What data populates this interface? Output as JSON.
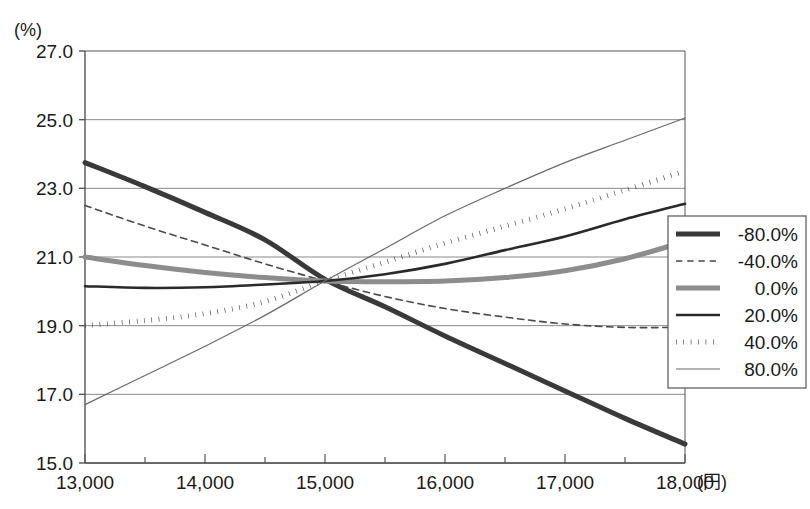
{
  "chart_data": {
    "type": "line",
    "title": "",
    "subtitle": "",
    "xlabel": "(円)",
    "ylabel": "(%)",
    "ylim": [
      15.0,
      27.0
    ],
    "xlim": [
      13000,
      18000
    ],
    "grid": true,
    "legend_position": "right",
    "y_ticks": [
      "15.0",
      "17.0",
      "19.0",
      "21.0",
      "23.0",
      "25.0",
      "27.0"
    ],
    "y_tick_values": [
      15.0,
      17.0,
      19.0,
      21.0,
      23.0,
      25.0,
      27.0
    ],
    "x_ticks": [
      "13,000",
      "14,000",
      "15,000",
      "16,000",
      "17,000",
      "18,000"
    ],
    "x_tick_values": [
      13000,
      14000,
      15000,
      16000,
      17000,
      18000
    ],
    "x_minor_step": 500,
    "x": [
      13000,
      13500,
      14000,
      14500,
      15000,
      15500,
      16000,
      16500,
      17000,
      17500,
      18000
    ],
    "series": [
      {
        "name": "-80.0%",
        "style": "solid",
        "width": 5,
        "color": "#3a3a3a",
        "values": [
          23.75,
          23.05,
          22.3,
          21.5,
          20.35,
          19.55,
          18.7,
          17.9,
          17.1,
          16.3,
          15.55
        ]
      },
      {
        "name": "-40.0%",
        "style": "dashed",
        "width": 1.6,
        "color": "#4a4a4a",
        "values": [
          22.5,
          21.9,
          21.35,
          20.8,
          20.3,
          19.85,
          19.5,
          19.25,
          19.05,
          18.95,
          18.95
        ]
      },
      {
        "name": "0.0%",
        "style": "solid",
        "width": 5,
        "color": "#8d8d8d",
        "values": [
          21.0,
          20.75,
          20.55,
          20.4,
          20.3,
          20.28,
          20.3,
          20.4,
          20.6,
          20.95,
          21.45
        ]
      },
      {
        "name": "20.0%",
        "style": "solid",
        "width": 2.6,
        "color": "#2a2a2a",
        "values": [
          20.15,
          20.1,
          20.12,
          20.2,
          20.3,
          20.5,
          20.8,
          21.2,
          21.6,
          22.1,
          22.55
        ]
      },
      {
        "name": "40.0%",
        "style": "dotted",
        "width": 5,
        "color": "#3a3a3a",
        "values": [
          19.0,
          19.15,
          19.35,
          19.7,
          20.3,
          20.85,
          21.4,
          21.9,
          22.4,
          22.95,
          23.5
        ]
      },
      {
        "name": "80.0%",
        "style": "solid",
        "width": 1.2,
        "color": "#6a6a6a",
        "values": [
          16.7,
          17.55,
          18.4,
          19.3,
          20.3,
          21.25,
          22.2,
          23.0,
          23.75,
          24.4,
          25.05
        ]
      }
    ],
    "legend_entries": [
      {
        "label": "-80.0%",
        "style": "solid",
        "width": 5,
        "color": "#3a3a3a"
      },
      {
        "label": "-40.0%",
        "style": "dashed",
        "width": 1.6,
        "color": "#4a4a4a"
      },
      {
        "label": "0.0%",
        "style": "solid",
        "width": 5,
        "color": "#8d8d8d"
      },
      {
        "label": "20.0%",
        "style": "solid",
        "width": 2.6,
        "color": "#2a2a2a"
      },
      {
        "label": "40.0%",
        "style": "dotted",
        "width": 5,
        "color": "#3a3a3a"
      },
      {
        "label": "80.0%",
        "style": "solid",
        "width": 1.2,
        "color": "#6a6a6a"
      }
    ],
    "axis_color": "#555555",
    "grid_color": "#8a8a8a",
    "background": "#ffffff"
  },
  "layout": {
    "plot_left": 85,
    "plot_right": 685,
    "plot_top": 51,
    "plot_bottom": 463
  }
}
